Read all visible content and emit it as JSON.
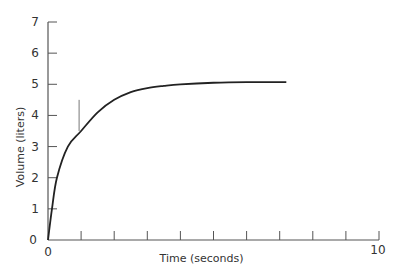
{
  "chart_data": {
    "type": "line",
    "title": "",
    "xlabel": "Time (seconds)",
    "ylabel": "Volume (liters)",
    "xlim": [
      0,
      10
    ],
    "ylim": [
      0,
      7
    ],
    "grid": false,
    "legend": null,
    "x_tick_labels": [
      "0",
      "10"
    ],
    "x_ticks": [
      0,
      1,
      2,
      3,
      4,
      5,
      6,
      7,
      8,
      9,
      10
    ],
    "y_tick_labels": [
      "0",
      "1",
      "2",
      "3",
      "4",
      "5",
      "6",
      "7"
    ],
    "y_ticks": [
      0,
      1,
      2,
      3,
      4,
      5,
      6,
      7
    ],
    "series": [
      {
        "name": "Volume",
        "color": "#222222",
        "x": [
          0,
          0.12,
          0.27,
          0.6,
          1.0,
          1.5,
          2.0,
          2.5,
          3.0,
          3.5,
          4.0,
          5.0,
          6.0,
          7.2
        ],
        "values": [
          0,
          1.0,
          2.0,
          3.0,
          3.5,
          4.1,
          4.5,
          4.75,
          4.88,
          4.95,
          5.0,
          5.05,
          5.07,
          5.07
        ]
      }
    ],
    "annotations": [
      {
        "type": "vertical-line",
        "x": 1.0,
        "y_from": 3.5,
        "y_to": 4.5
      }
    ]
  }
}
